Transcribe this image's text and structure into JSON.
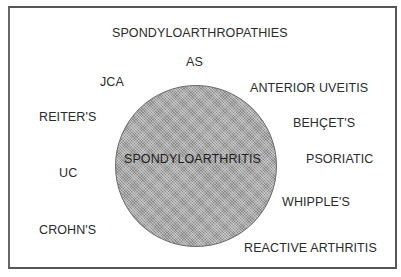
{
  "diagram": {
    "outer_label": "SPONDYLOARTHROPATHIES",
    "inner_label": "SPONDYLOARTHRITIS",
    "conditions": [
      {
        "name": "AS"
      },
      {
        "name": "JCA"
      },
      {
        "name": "ANTERIOR UVEITIS"
      },
      {
        "name": "REITER'S"
      },
      {
        "name": "BEHÇET'S"
      },
      {
        "name": "UC"
      },
      {
        "name": "PSORIATIC"
      },
      {
        "name": "WHIPPLE'S"
      },
      {
        "name": "CROHN'S"
      },
      {
        "name": "REACTIVE ARTHRITIS"
      }
    ],
    "colors": {
      "border": "#555555",
      "circle_fill": "#a8a8a8",
      "text": "#2b2b2b"
    }
  }
}
